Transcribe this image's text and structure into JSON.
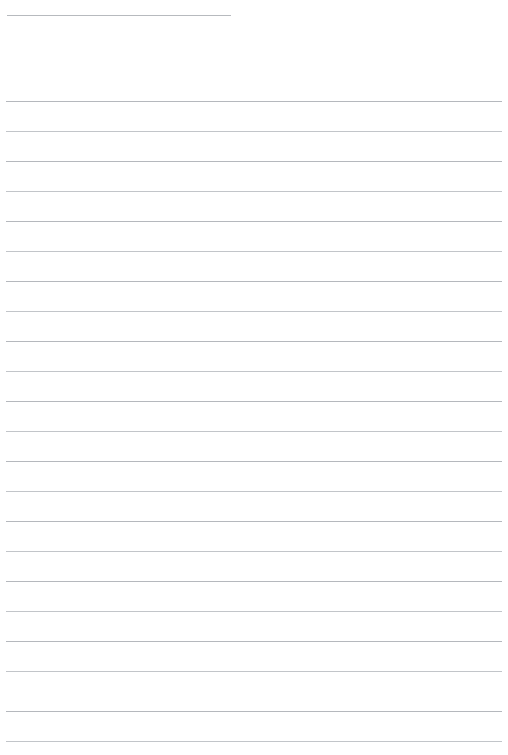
{
  "document": {
    "kind": "lined-paper-template",
    "title": "",
    "page_width": 508,
    "page_height": 755,
    "background_color": "#ffffff",
    "orientation": "portrait",
    "visible_text": ""
  },
  "header_rule": {
    "name": "header-name-rule",
    "x": 7,
    "y": 15,
    "width": 224,
    "color": "#b7babe",
    "thickness": 1,
    "label": ""
  },
  "ruling": {
    "line_color": "#bcbfc3",
    "line_thickness": 1,
    "left_margin": 6,
    "right_margin": 6,
    "line_width": 496,
    "first_line_y": 101,
    "line_spacing": 30,
    "line_count": 22,
    "lines": [
      {
        "index": 1,
        "y": 101,
        "tint": "tint-a"
      },
      {
        "index": 2,
        "y": 131,
        "tint": "tint-b"
      },
      {
        "index": 3,
        "y": 161,
        "tint": "tint-a"
      },
      {
        "index": 4,
        "y": 191,
        "tint": "tint-b"
      },
      {
        "index": 5,
        "y": 221,
        "tint": "tint-a"
      },
      {
        "index": 6,
        "y": 251,
        "tint": "tint-b"
      },
      {
        "index": 7,
        "y": 281,
        "tint": "tint-a"
      },
      {
        "index": 8,
        "y": 311,
        "tint": "tint-b"
      },
      {
        "index": 9,
        "y": 341,
        "tint": "tint-a"
      },
      {
        "index": 10,
        "y": 371,
        "tint": "tint-b"
      },
      {
        "index": 11,
        "y": 401,
        "tint": "tint-a"
      },
      {
        "index": 12,
        "y": 431,
        "tint": "tint-b"
      },
      {
        "index": 13,
        "y": 461,
        "tint": "tint-a"
      },
      {
        "index": 14,
        "y": 491,
        "tint": "tint-b"
      },
      {
        "index": 15,
        "y": 521,
        "tint": "tint-a"
      },
      {
        "index": 16,
        "y": 551,
        "tint": "tint-b"
      },
      {
        "index": 17,
        "y": 581,
        "tint": "tint-a"
      },
      {
        "index": 18,
        "y": 611,
        "tint": "tint-b"
      },
      {
        "index": 19,
        "y": 641,
        "tint": "tint-a"
      },
      {
        "index": 20,
        "y": 671,
        "tint": "tint-b"
      },
      {
        "index": 21,
        "y": 711,
        "tint": "tint-a"
      },
      {
        "index": 22,
        "y": 741,
        "tint": "tint-b"
      }
    ]
  }
}
